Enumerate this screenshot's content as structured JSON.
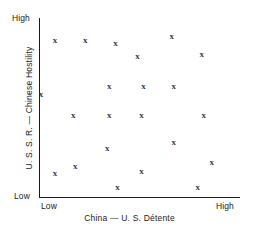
{
  "axes": {
    "y_title": "U. S. S. R. — Chinese Hostility",
    "x_title": "China — U. S. Détente",
    "y_high": "High",
    "y_low": "Low",
    "x_low": "Low",
    "x_high": "High"
  },
  "marker_glyph": "x",
  "chart_data": {
    "type": "scatter",
    "title": "",
    "xlabel": "China — U. S. Détente",
    "ylabel": "U. S. S. R. — Chinese Hostility",
    "xlim": [
      0,
      100
    ],
    "ylim": [
      0,
      100
    ],
    "xtick_labels": [
      "Low",
      "High"
    ],
    "ytick_labels": [
      "Low",
      "High"
    ],
    "grid": false,
    "legend": null,
    "marker": "x",
    "marker_color": "#3a3a3a",
    "axis_color": "#1a1a1a",
    "points": [
      {
        "x": 8,
        "y": 88
      },
      {
        "x": 23,
        "y": 88
      },
      {
        "x": 38,
        "y": 86
      },
      {
        "x": 66,
        "y": 90
      },
      {
        "x": 49,
        "y": 79
      },
      {
        "x": 81,
        "y": 80
      },
      {
        "x": 1,
        "y": 58
      },
      {
        "x": 35,
        "y": 62
      },
      {
        "x": 52,
        "y": 62
      },
      {
        "x": 67,
        "y": 62
      },
      {
        "x": 17,
        "y": 46
      },
      {
        "x": 35,
        "y": 46
      },
      {
        "x": 51,
        "y": 46
      },
      {
        "x": 82,
        "y": 46
      },
      {
        "x": 34,
        "y": 28
      },
      {
        "x": 67,
        "y": 31
      },
      {
        "x": 18,
        "y": 18
      },
      {
        "x": 51,
        "y": 15
      },
      {
        "x": 86,
        "y": 20
      },
      {
        "x": 8,
        "y": 14
      },
      {
        "x": 39,
        "y": 6
      },
      {
        "x": 79,
        "y": 6
      }
    ]
  }
}
